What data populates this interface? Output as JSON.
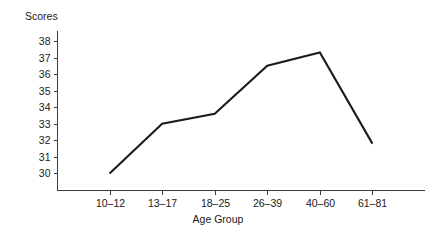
{
  "chart_data": {
    "type": "line",
    "title": "",
    "xlabel": "Age Group",
    "ylabel": "Scores",
    "categories": [
      "10–12",
      "13–17",
      "18–25",
      "26–39",
      "40–60",
      "61–81"
    ],
    "values": [
      30.0,
      33.0,
      33.6,
      36.5,
      37.3,
      31.8
    ],
    "series": [
      {
        "name": "Scores",
        "values": [
          30.0,
          33.0,
          33.6,
          36.5,
          37.3,
          31.8
        ]
      }
    ],
    "yticks": [
      30,
      31,
      32,
      33,
      34,
      35,
      36,
      37,
      38
    ],
    "ytick_labels": [
      "30",
      "31",
      "32",
      "33",
      "34",
      "35",
      "36",
      "37",
      "38"
    ],
    "ylim": [
      29.0,
      38.6
    ],
    "xlim": [
      0,
      7
    ],
    "grid": false,
    "legend": false,
    "legend_position": "none",
    "line_color": "#1c1c1c",
    "axis_color": "#3c3c3c",
    "background_color": "#ffffff"
  }
}
